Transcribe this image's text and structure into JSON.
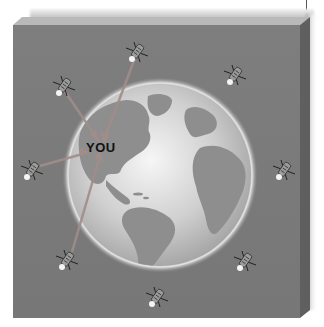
{
  "diagram": {
    "user_label": "YOU",
    "colors": {
      "panel_face": "#7b7b7b",
      "panel_top": "#b8b8b8",
      "panel_side": "#5e5e5e",
      "globe_light": "#f4f4f4",
      "globe_dark": "#9a9a9a",
      "land": "#8c8c8c",
      "signal_line": "#9b8a86"
    },
    "globe": {
      "cx": 160,
      "cy": 175,
      "r": 92,
      "view": "Americas and Atlantic"
    },
    "satellites": [
      {
        "id": "sat-1",
        "x": 64,
        "y": 86,
        "connected": true
      },
      {
        "id": "sat-2",
        "x": 137,
        "y": 52,
        "connected": true
      },
      {
        "id": "sat-3",
        "x": 235,
        "y": 75,
        "connected": false
      },
      {
        "id": "sat-4",
        "x": 32,
        "y": 170,
        "connected": true
      },
      {
        "id": "sat-5",
        "x": 284,
        "y": 170,
        "connected": false
      },
      {
        "id": "sat-6",
        "x": 67,
        "y": 260,
        "connected": true
      },
      {
        "id": "sat-7",
        "x": 245,
        "y": 261,
        "connected": false
      },
      {
        "id": "sat-8",
        "x": 157,
        "y": 297,
        "connected": false
      }
    ],
    "receiver": {
      "x": 100,
      "y": 148
    }
  }
}
